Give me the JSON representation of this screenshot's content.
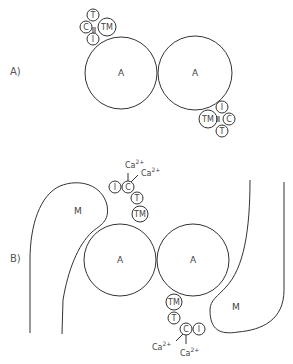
{
  "diagram": {
    "panels": [
      {
        "label": "A)",
        "actin": [
          {
            "label": "A"
          },
          {
            "label": "A"
          }
        ],
        "complexes": [
          {
            "position": "top-left",
            "subunits": [
              "T",
              "C",
              "I",
              "TM"
            ]
          },
          {
            "position": "bottom-right",
            "subunits": [
              "I",
              "C",
              "T",
              "TM"
            ]
          }
        ]
      },
      {
        "label": "B)",
        "actin": [
          {
            "label": "A"
          },
          {
            "label": "A"
          }
        ],
        "myosin": [
          {
            "label": "M"
          },
          {
            "label": "M"
          }
        ],
        "complexes": [
          {
            "position": "top",
            "subunits": [
              "I",
              "C",
              "T",
              "TM"
            ],
            "calcium": [
              "Ca",
              "Ca"
            ]
          },
          {
            "position": "bottom",
            "subunits": [
              "TM",
              "T",
              "C",
              "I"
            ],
            "calcium": [
              "Ca",
              "Ca"
            ]
          }
        ]
      }
    ],
    "calcium_label": "Ca",
    "calcium_charge": "2+"
  }
}
